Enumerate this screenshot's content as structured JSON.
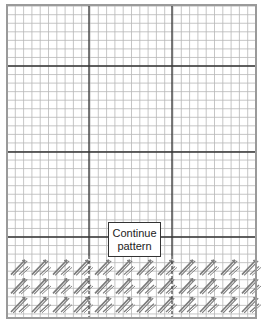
{
  "diagram": {
    "type": "needlepoint-stitch-chart",
    "label_box": {
      "line1": "Continue",
      "line2": "pattern"
    },
    "cropped_caption_fragment": "",
    "grid": {
      "left": 7,
      "right": 256,
      "top": 5,
      "bottom": 318,
      "columns": 30,
      "cell_width": 8.3,
      "cell_height": 8.55,
      "major_vertical_lines_x": [
        89,
        172
      ],
      "major_horizontal_lines_y": [
        66,
        152,
        237
      ],
      "stitch_region_top": 258
    },
    "stitch_pattern": {
      "direction": "diagonal-bottom-left-to-top-right",
      "repeat_width_px": 21,
      "rows": 3
    },
    "colors": {
      "minor_grid": "#b8b8b8",
      "major_grid": "#333333",
      "border": "#9a9a9a",
      "stitch": "#7a7a7a",
      "background": "#ffffff"
    }
  }
}
